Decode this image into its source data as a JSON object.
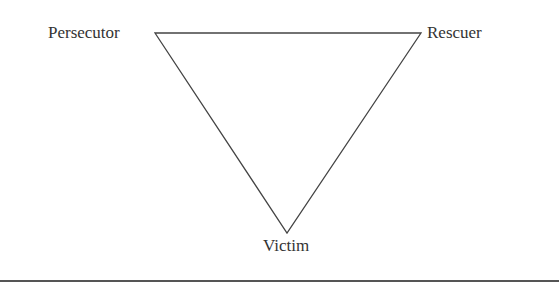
{
  "diagram": {
    "type": "drama-triangle",
    "nodes": [
      {
        "id": "persecutor",
        "label": "Persecutor",
        "position": "top-left"
      },
      {
        "id": "rescuer",
        "label": "Rescuer",
        "position": "top-right"
      },
      {
        "id": "victim",
        "label": "Victim",
        "position": "bottom"
      }
    ],
    "edges": [
      {
        "from": "persecutor",
        "to": "rescuer"
      },
      {
        "from": "rescuer",
        "to": "victim"
      },
      {
        "from": "victim",
        "to": "persecutor"
      }
    ],
    "colors": {
      "line": "#444444",
      "text": "#333333",
      "background": "#ffffff"
    }
  }
}
